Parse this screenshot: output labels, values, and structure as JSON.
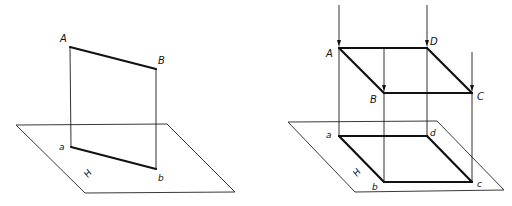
{
  "figures": [
    {
      "id": "left",
      "description": "Orthographic projection of line segment AB onto plane H",
      "plane": {
        "label": "H",
        "label_pos": [
          88,
          178
        ],
        "corners": [
          [
            16,
            125
          ],
          [
            167,
            124
          ],
          [
            235,
            192
          ],
          [
            85,
            193
          ]
        ]
      },
      "space_points": [
        {
          "name": "A",
          "pos": [
            70,
            47
          ],
          "label_pos": [
            60,
            42
          ]
        },
        {
          "name": "B",
          "pos": [
            156,
            69
          ],
          "label_pos": [
            158,
            64
          ]
        }
      ],
      "projections": [
        {
          "name": "a",
          "pos": [
            71,
            147
          ],
          "label_pos": [
            59,
            150
          ]
        },
        {
          "name": "b",
          "pos": [
            156,
            169
          ],
          "label_pos": [
            158,
            181
          ]
        }
      ],
      "thick_segments": [
        [
          "A",
          "B"
        ],
        [
          "a",
          "b"
        ]
      ],
      "projectors": [
        [
          "A",
          "a"
        ],
        [
          "B",
          "b"
        ]
      ],
      "arrows": []
    },
    {
      "id": "right",
      "description": "Parallel projection of parallelogram ABCD onto plane H",
      "plane": {
        "label": "H",
        "label_pos": [
          357,
          177
        ],
        "corners": [
          [
            288,
            122
          ],
          [
            437,
            121
          ],
          [
            504,
            190
          ],
          [
            355,
            192
          ]
        ]
      },
      "space_points": [
        {
          "name": "A",
          "pos": [
            339,
            48
          ],
          "label_pos": [
            326,
            57
          ]
        },
        {
          "name": "D",
          "pos": [
            427,
            48
          ],
          "label_pos": [
            430,
            45
          ]
        },
        {
          "name": "B",
          "pos": [
            384,
            93
          ],
          "label_pos": [
            370,
            103
          ]
        },
        {
          "name": "C",
          "pos": [
            472,
            93
          ],
          "label_pos": [
            477,
            100
          ]
        }
      ],
      "projections": [
        {
          "name": "a",
          "pos": [
            339,
            136
          ],
          "label_pos": [
            326,
            138
          ]
        },
        {
          "name": "d",
          "pos": [
            427,
            136
          ],
          "label_pos": [
            430,
            136
          ]
        },
        {
          "name": "b",
          "pos": [
            384,
            182
          ],
          "label_pos": [
            372,
            190
          ]
        },
        {
          "name": "c",
          "pos": [
            472,
            182
          ],
          "label_pos": [
            477,
            187
          ]
        }
      ],
      "thick_segments": [
        [
          "A",
          "D"
        ],
        [
          "A",
          "B"
        ],
        [
          "B",
          "C"
        ],
        [
          "D",
          "C"
        ],
        [
          "a",
          "d"
        ],
        [
          "a",
          "b"
        ],
        [
          "b",
          "c"
        ],
        [
          "d",
          "c"
        ]
      ],
      "projectors": [
        [
          "A",
          "a"
        ],
        [
          "D",
          "d"
        ],
        [
          "B",
          "b"
        ],
        [
          "C",
          "c"
        ]
      ],
      "arrows": [
        {
          "from": [
            339,
            5
          ],
          "to": [
            339,
            47
          ]
        },
        {
          "from": [
            427,
            5
          ],
          "to": [
            427,
            47
          ]
        },
        {
          "from": [
            384,
            48
          ],
          "to": [
            384,
            92
          ]
        },
        {
          "from": [
            472,
            52
          ],
          "to": [
            472,
            92
          ]
        }
      ]
    }
  ]
}
